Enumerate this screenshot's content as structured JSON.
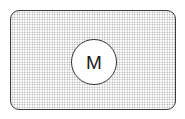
{
  "diagram": {
    "container": {
      "shape": "rounded-rectangle",
      "fill": "stippled-dots",
      "border_color": "#3a3a3a"
    },
    "node": {
      "shape": "circle",
      "label": "M",
      "fill": "#ffffff",
      "border_color": "#333333"
    }
  }
}
